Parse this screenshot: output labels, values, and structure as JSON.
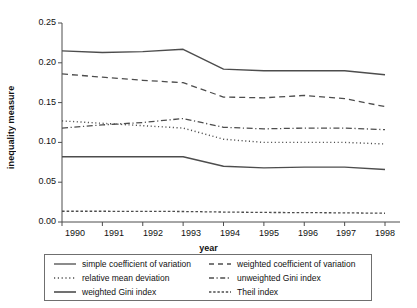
{
  "chart_data": {
    "type": "line",
    "title": "",
    "subtitle": "",
    "xlabel": "year",
    "ylabel": "inequality measure",
    "x": [
      1990,
      1991,
      1992,
      1993,
      1994,
      1995,
      1996,
      1997,
      1998
    ],
    "xtick_labels": [
      "1990",
      "1991",
      "1992",
      "1993",
      "1994",
      "1995",
      "1996",
      "1997",
      "1998"
    ],
    "ytick_labels": [
      "0.00",
      "0.05",
      "0.10",
      "0.15",
      "0.20",
      "0.25"
    ],
    "ytick_values": [
      0.0,
      0.05,
      0.1,
      0.15,
      0.2,
      0.25
    ],
    "ylim": [
      0.0,
      0.25
    ],
    "xlim": [
      1990,
      1998
    ],
    "grid": false,
    "legend_position": "below-plot",
    "series": [
      {
        "name": "simple coefficient of variation",
        "style": "solid",
        "color": "#4d4d4d",
        "values": [
          0.215,
          0.213,
          0.214,
          0.217,
          0.192,
          0.19,
          0.19,
          0.19,
          0.185
        ]
      },
      {
        "name": "weighted coefficient of variation",
        "style": "dashed",
        "color": "#4d4d4d",
        "values": [
          0.186,
          0.182,
          0.178,
          0.175,
          0.157,
          0.156,
          0.159,
          0.155,
          0.145
        ]
      },
      {
        "name": "relative mean deviation",
        "style": "dotted",
        "color": "#4d4d4d",
        "values": [
          0.127,
          0.124,
          0.121,
          0.118,
          0.104,
          0.1,
          0.1,
          0.1,
          0.098
        ]
      },
      {
        "name": "unweighted Gini index",
        "style": "dash-dot",
        "color": "#4d4d4d",
        "values": [
          0.118,
          0.122,
          0.125,
          0.13,
          0.119,
          0.117,
          0.118,
          0.118,
          0.116
        ]
      },
      {
        "name": "weighted Gini index",
        "style": "solid",
        "color": "#4d4d4d",
        "values": [
          0.082,
          0.082,
          0.082,
          0.082,
          0.07,
          0.068,
          0.069,
          0.069,
          0.066
        ]
      },
      {
        "name": "Theil index",
        "style": "fine-dashed",
        "color": "#4d4d4d",
        "values": [
          0.0135,
          0.0135,
          0.0133,
          0.0132,
          0.0125,
          0.012,
          0.0118,
          0.0115,
          0.011
        ]
      }
    ],
    "legend": [
      "simple coefficient of variation",
      "weighted coefficient of variation",
      "relative mean deviation",
      "unweighted Gini index",
      "weighted Gini index",
      "Theil index"
    ]
  }
}
